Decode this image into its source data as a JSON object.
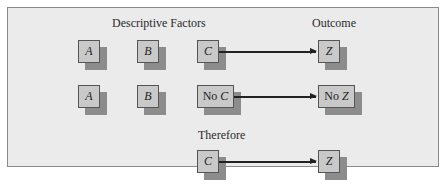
{
  "headers": {
    "factors": "Descriptive Factors",
    "outcome": "Outcome",
    "therefore": "Therefore"
  },
  "rows": [
    {
      "a": "A",
      "b": "B",
      "cause_prefix": "",
      "cause": "C",
      "effect_prefix": "",
      "effect": "Z"
    },
    {
      "a": "A",
      "b": "B",
      "cause_prefix": "No ",
      "cause": "C",
      "effect_prefix": "No ",
      "effect": "Z"
    }
  ],
  "conclusion": {
    "cause": "C",
    "effect": "Z"
  },
  "colors": {
    "panel_bg": "#ebebeb",
    "node_face": "#c9c9c9",
    "node_shadow": "#8c8c8c",
    "border": "#555555"
  }
}
